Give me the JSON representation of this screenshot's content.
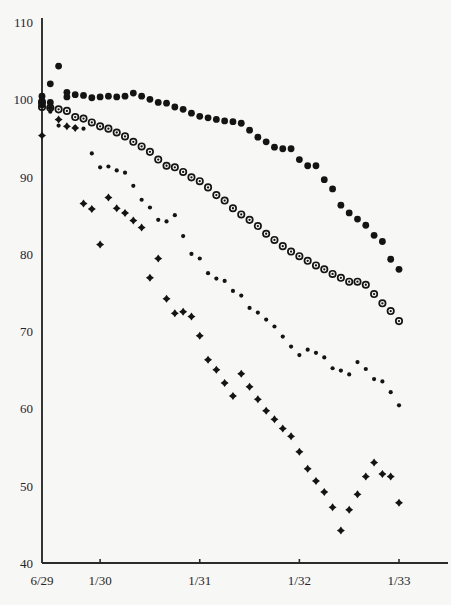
{
  "chart_data": {
    "type": "scatter",
    "title": "",
    "subtitle": "",
    "xlabel": "",
    "ylabel": "",
    "xlim": [
      0,
      43
    ],
    "ylim": [
      40,
      110
    ],
    "grid": false,
    "legend": "none",
    "yticks": [
      40,
      50,
      60,
      70,
      80,
      90,
      100,
      110
    ],
    "ytick_labels": [
      "40",
      "50",
      "60",
      "70",
      "80",
      "90",
      "100",
      "110"
    ],
    "xticks": [
      0,
      7,
      19,
      31,
      43
    ],
    "xtick_labels": [
      "6/29",
      "1/30",
      "1/31",
      "1/32",
      "1/33"
    ],
    "x_unit": "months since 6/29",
    "series": [
      {
        "name": "series-1",
        "marker": "filled-circle",
        "color": "#141414",
        "x": [
          0,
          0,
          0,
          1,
          1,
          2,
          3,
          3,
          4,
          5,
          6,
          7,
          8,
          9,
          10,
          11,
          12,
          13,
          14,
          15,
          16,
          17,
          18,
          19,
          20,
          21,
          22,
          23,
          24,
          25,
          26,
          27,
          28,
          29,
          30,
          31,
          32,
          33,
          34,
          35,
          36,
          37,
          38,
          39,
          40,
          41,
          42,
          43
        ],
        "values": [
          100.4,
          99.8,
          99.3,
          102.0,
          99.6,
          104.3,
          100.9,
          100.3,
          100.6,
          100.5,
          100.2,
          100.3,
          100.4,
          100.3,
          100.4,
          100.8,
          100.4,
          100.0,
          99.6,
          99.5,
          99.0,
          98.7,
          98.2,
          97.8,
          97.6,
          97.4,
          97.2,
          97.1,
          96.9,
          96.0,
          95.1,
          94.5,
          93.8,
          93.6,
          93.6,
          92.2,
          91.4,
          91.4,
          89.6,
          88.4,
          86.3,
          85.3,
          84.5,
          83.7,
          82.4,
          81.6,
          79.3,
          78.0
        ]
      },
      {
        "name": "series-2",
        "marker": "circle-with-dot",
        "color": "#141414",
        "x": [
          0,
          0,
          1,
          2,
          3,
          4,
          5,
          6,
          7,
          8,
          9,
          10,
          11,
          12,
          13,
          14,
          15,
          16,
          17,
          18,
          19,
          20,
          21,
          22,
          23,
          24,
          25,
          26,
          27,
          28,
          29,
          30,
          31,
          32,
          33,
          34,
          35,
          36,
          37,
          38,
          39,
          40,
          41,
          42,
          43
        ],
        "values": [
          99.6,
          99.0,
          98.9,
          98.7,
          98.5,
          97.7,
          97.5,
          97.0,
          96.5,
          96.2,
          95.7,
          95.2,
          94.5,
          93.9,
          93.2,
          92.2,
          91.4,
          91.2,
          90.6,
          89.9,
          89.4,
          88.6,
          87.6,
          86.9,
          85.9,
          85.1,
          84.4,
          83.6,
          82.6,
          81.8,
          81.0,
          80.3,
          79.7,
          79.1,
          78.5,
          78.0,
          77.4,
          76.9,
          76.4,
          76.4,
          76.0,
          74.8,
          73.6,
          72.6,
          71.3
        ]
      },
      {
        "name": "series-3",
        "marker": "small-dot",
        "color": "#141414",
        "x": [
          0,
          1,
          2,
          4,
          5,
          6,
          7,
          8,
          9,
          10,
          11,
          12,
          13,
          14,
          15,
          16,
          17,
          18,
          19,
          20,
          21,
          22,
          23,
          24,
          25,
          26,
          27,
          28,
          29,
          30,
          31,
          32,
          33,
          34,
          35,
          36,
          37,
          38,
          39,
          40,
          41,
          42,
          43
        ],
        "values": [
          99.7,
          98.4,
          96.6,
          96.4,
          96.2,
          93.0,
          91.2,
          91.3,
          90.8,
          90.5,
          88.8,
          87.0,
          86.0,
          84.4,
          84.2,
          85.0,
          82.3,
          80.0,
          79.4,
          77.5,
          76.8,
          76.5,
          75.2,
          74.6,
          73.0,
          72.4,
          71.5,
          70.6,
          69.3,
          68.0,
          66.9,
          67.6,
          67.2,
          66.6,
          65.2,
          64.9,
          64.4,
          66.0,
          65.1,
          63.8,
          63.5,
          62.1,
          60.4
        ]
      },
      {
        "name": "series-4",
        "marker": "four-point-star",
        "color": "#141414",
        "x": [
          0,
          1,
          2,
          3,
          4,
          5,
          6,
          7,
          8,
          9,
          10,
          11,
          12,
          13,
          14,
          15,
          16,
          17,
          18,
          19,
          20,
          21,
          22,
          23,
          24,
          25,
          26,
          27,
          28,
          29,
          30,
          31,
          32,
          33,
          34,
          35,
          36,
          37,
          38,
          39,
          40,
          41,
          42,
          43
        ],
        "values": [
          95.3,
          98.9,
          97.4,
          96.5,
          96.3,
          86.5,
          85.8,
          81.2,
          87.3,
          85.9,
          85.3,
          84.3,
          83.4,
          76.9,
          79.4,
          74.2,
          72.3,
          72.5,
          71.9,
          69.4,
          66.3,
          65.0,
          63.3,
          61.6,
          64.5,
          62.8,
          61.2,
          59.7,
          58.6,
          57.4,
          56.4,
          54.4,
          52.2,
          50.6,
          49.2,
          47.2,
          44.2,
          46.9,
          48.9,
          51.2,
          53.0,
          51.5,
          51.2,
          47.8
        ]
      }
    ]
  },
  "axes": {
    "y_axis_name": "y-axis",
    "x_axis_name": "x-axis"
  }
}
